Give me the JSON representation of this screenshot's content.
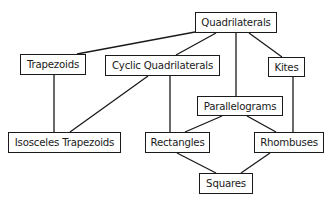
{
  "diagram": {
    "type": "hierarchy",
    "title": "",
    "nodes": [
      {
        "id": "quadrilaterals",
        "label": "Quadrilaterals",
        "x": 195,
        "y": 12,
        "w": 82,
        "h": 21
      },
      {
        "id": "trapezoids",
        "label": "Trapezoids",
        "x": 20,
        "y": 54,
        "w": 66,
        "h": 21
      },
      {
        "id": "cyclic",
        "label": "Cyclic Quadrilaterals",
        "x": 105,
        "y": 55,
        "w": 115,
        "h": 21
      },
      {
        "id": "kites",
        "label": "Kites",
        "x": 268,
        "y": 57,
        "w": 37,
        "h": 20
      },
      {
        "id": "parallelograms",
        "label": "Parallelograms",
        "x": 197,
        "y": 96,
        "w": 86,
        "h": 20
      },
      {
        "id": "isosceles",
        "label": "Isosceles Trapezoids",
        "x": 8,
        "y": 132,
        "w": 113,
        "h": 21
      },
      {
        "id": "rectangles",
        "label": "Rectangles",
        "x": 145,
        "y": 132,
        "w": 65,
        "h": 21
      },
      {
        "id": "rhombuses",
        "label": "Rhombuses",
        "x": 254,
        "y": 132,
        "w": 70,
        "h": 21
      },
      {
        "id": "squares",
        "label": "Squares",
        "x": 199,
        "y": 173,
        "w": 54,
        "h": 21
      }
    ],
    "edges": [
      {
        "from": "quadrilaterals",
        "to": "trapezoids",
        "x1": 195,
        "y1": 32,
        "x2": 77,
        "y2": 54
      },
      {
        "from": "quadrilaterals",
        "to": "cyclic",
        "x1": 216,
        "y1": 33,
        "x2": 176,
        "y2": 55
      },
      {
        "from": "quadrilaterals",
        "to": "parallelograms",
        "x1": 236,
        "y1": 33,
        "x2": 236,
        "y2": 96
      },
      {
        "from": "quadrilaterals",
        "to": "kites",
        "x1": 249,
        "y1": 33,
        "x2": 282,
        "y2": 57
      },
      {
        "from": "trapezoids",
        "to": "isosceles",
        "x1": 54,
        "y1": 75,
        "x2": 54,
        "y2": 132
      },
      {
        "from": "cyclic",
        "to": "isosceles",
        "x1": 148,
        "y1": 76,
        "x2": 70,
        "y2": 132
      },
      {
        "from": "cyclic",
        "to": "rectangles",
        "x1": 170,
        "y1": 76,
        "x2": 170,
        "y2": 132
      },
      {
        "from": "kites",
        "to": "rhombuses",
        "x1": 293,
        "y1": 77,
        "x2": 293,
        "y2": 132
      },
      {
        "from": "parallelograms",
        "to": "rectangles",
        "x1": 222,
        "y1": 116,
        "x2": 185,
        "y2": 132
      },
      {
        "from": "parallelograms",
        "to": "rhombuses",
        "x1": 247,
        "y1": 116,
        "x2": 276,
        "y2": 132
      },
      {
        "from": "rectangles",
        "to": "squares",
        "x1": 177,
        "y1": 153,
        "x2": 216,
        "y2": 173
      },
      {
        "from": "rhombuses",
        "to": "squares",
        "x1": 270,
        "y1": 153,
        "x2": 241,
        "y2": 173
      }
    ],
    "colors": {
      "stroke": "#1a1a1a",
      "background": "#ffffff",
      "text": "#1a1a1a"
    }
  }
}
